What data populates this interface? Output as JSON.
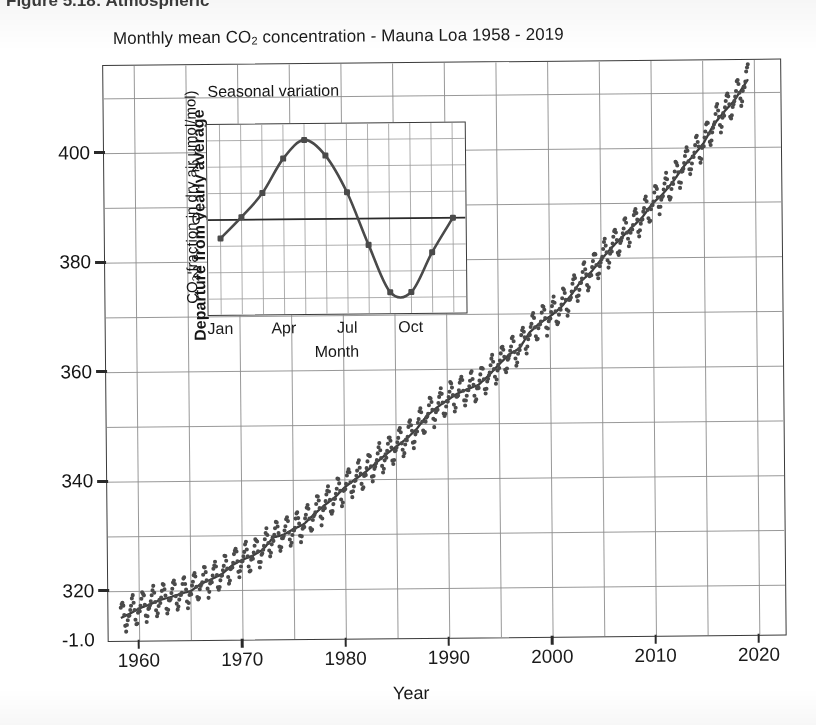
{
  "page": {
    "caption_partial": "Figure 5.18: Atmospheric"
  },
  "chart_data": {
    "type": "scatter",
    "title": "Monthly mean CO2 concentration - Mauna Loa 1958 - 2019",
    "title_prefix": "Monthly mean CO",
    "title_sub": "2",
    "title_suffix": " concentration - Mauna Loa 1958 - 2019",
    "xlabel": "Year",
    "ylabel": "CO2 fraction in dry air µmol/mol)",
    "ylabel_prefix": "CO",
    "ylabel_sub": "2",
    "ylabel_suffix": " fraction in dry air µmol/mol)",
    "xlim": [
      1957.0,
      2022.5
    ],
    "ylim": [
      311.0,
      416.0
    ],
    "xticks": [
      1960,
      1970,
      1980,
      1990,
      2000,
      2010,
      2020
    ],
    "xtick_labels": [
      "1960",
      "1970",
      "1980",
      "1990",
      "2000",
      "2010",
      "2020"
    ],
    "yticks": [
      320,
      340,
      360,
      380,
      400
    ],
    "ytick_labels": [
      "320",
      "340",
      "360",
      "380",
      "400"
    ],
    "origin_artifact_label": "-1.0",
    "grid": true,
    "grid_x_step_years": 5,
    "grid_y_step_ppm": 10,
    "marker_color": "#4a4a4a",
    "trend_color": "#3c3c3c",
    "series_name": "Monthly mean CO2",
    "trend_name": "Smoothed annual trend",
    "seasonal_amplitude_ppm": 3.0,
    "annual_trend": [
      {
        "year": 1958,
        "ppm": 315.0
      },
      {
        "year": 1959,
        "ppm": 315.9
      },
      {
        "year": 1960,
        "ppm": 316.9
      },
      {
        "year": 1961,
        "ppm": 317.6
      },
      {
        "year": 1962,
        "ppm": 318.4
      },
      {
        "year": 1963,
        "ppm": 318.9
      },
      {
        "year": 1964,
        "ppm": 319.5
      },
      {
        "year": 1965,
        "ppm": 320.0
      },
      {
        "year": 1966,
        "ppm": 321.3
      },
      {
        "year": 1967,
        "ppm": 322.1
      },
      {
        "year": 1968,
        "ppm": 323.0
      },
      {
        "year": 1969,
        "ppm": 324.6
      },
      {
        "year": 1970,
        "ppm": 325.6
      },
      {
        "year": 1971,
        "ppm": 326.3
      },
      {
        "year": 1972,
        "ppm": 327.4
      },
      {
        "year": 1973,
        "ppm": 329.6
      },
      {
        "year": 1974,
        "ppm": 330.1
      },
      {
        "year": 1975,
        "ppm": 331.1
      },
      {
        "year": 1976,
        "ppm": 332.0
      },
      {
        "year": 1977,
        "ppm": 333.8
      },
      {
        "year": 1978,
        "ppm": 335.4
      },
      {
        "year": 1979,
        "ppm": 336.8
      },
      {
        "year": 1980,
        "ppm": 338.7
      },
      {
        "year": 1981,
        "ppm": 340.1
      },
      {
        "year": 1982,
        "ppm": 341.4
      },
      {
        "year": 1983,
        "ppm": 343.0
      },
      {
        "year": 1984,
        "ppm": 344.6
      },
      {
        "year": 1985,
        "ppm": 346.0
      },
      {
        "year": 1986,
        "ppm": 347.4
      },
      {
        "year": 1987,
        "ppm": 349.2
      },
      {
        "year": 1988,
        "ppm": 351.6
      },
      {
        "year": 1989,
        "ppm": 353.1
      },
      {
        "year": 1990,
        "ppm": 354.4
      },
      {
        "year": 1991,
        "ppm": 355.6
      },
      {
        "year": 1992,
        "ppm": 356.4
      },
      {
        "year": 1993,
        "ppm": 357.1
      },
      {
        "year": 1994,
        "ppm": 358.8
      },
      {
        "year": 1995,
        "ppm": 360.8
      },
      {
        "year": 1996,
        "ppm": 362.6
      },
      {
        "year": 1997,
        "ppm": 363.7
      },
      {
        "year": 1998,
        "ppm": 366.6
      },
      {
        "year": 1999,
        "ppm": 368.3
      },
      {
        "year": 2000,
        "ppm": 369.5
      },
      {
        "year": 2001,
        "ppm": 371.0
      },
      {
        "year": 2002,
        "ppm": 373.2
      },
      {
        "year": 2003,
        "ppm": 375.8
      },
      {
        "year": 2004,
        "ppm": 377.5
      },
      {
        "year": 2005,
        "ppm": 379.8
      },
      {
        "year": 2006,
        "ppm": 381.9
      },
      {
        "year": 2007,
        "ppm": 383.8
      },
      {
        "year": 2008,
        "ppm": 385.6
      },
      {
        "year": 2009,
        "ppm": 387.4
      },
      {
        "year": 2010,
        "ppm": 389.9
      },
      {
        "year": 2011,
        "ppm": 391.6
      },
      {
        "year": 2012,
        "ppm": 393.8
      },
      {
        "year": 2013,
        "ppm": 396.5
      },
      {
        "year": 2014,
        "ppm": 398.6
      },
      {
        "year": 2015,
        "ppm": 400.8
      },
      {
        "year": 2016,
        "ppm": 404.2
      },
      {
        "year": 2017,
        "ppm": 406.5
      },
      {
        "year": 2018,
        "ppm": 408.5
      },
      {
        "year": 2019,
        "ppm": 411.4
      }
    ],
    "inset": {
      "type": "line",
      "title": "Seasonal variation",
      "xlabel": "Month",
      "ylabel_a": "CO2 fraction in dry air µmol/mol)",
      "ylabel_a_prefix": "CO",
      "ylabel_a_sub": "2",
      "ylabel_a_suffix": " fraction in dry air µmol/mol)",
      "ylabel_b": "Departure from yearly average",
      "categories": [
        "Jan",
        "Feb",
        "Mar",
        "Apr",
        "May",
        "Jun",
        "Jul",
        "Aug",
        "Sep",
        "Oct",
        "Nov",
        "Dec"
      ],
      "xtick_labels": [
        "Jan",
        "Apr",
        "Jul",
        "Oct"
      ],
      "xticks": [
        1,
        4,
        7,
        10
      ],
      "values": [
        -0.7,
        0.1,
        1.0,
        2.3,
        3.0,
        2.4,
        1.0,
        -1.0,
        -2.8,
        -2.8,
        -1.3,
        0.0
      ],
      "yticks": [
        -2,
        0,
        2
      ],
      "ytick_labels": [
        "-2",
        "0",
        "2"
      ],
      "ylim": [
        -3.6,
        3.6
      ],
      "xlim": [
        0.4,
        12.6
      ],
      "grid": true,
      "zero_line": true,
      "line_color": "#4a4a4a",
      "marker_color": "#4a4a4a"
    }
  }
}
